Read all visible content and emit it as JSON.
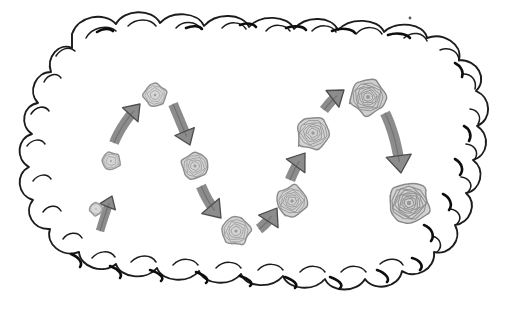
{
  "illustration": {
    "title": "Hand-drawn cloud containing a zigzag sequence of growing spiral swirls connected by arrows",
    "style": "hand-drawn sketch, black ink outline, grayscale fills",
    "background_color": "#ffffff",
    "ink_color": "#1a1a1a",
    "arrow_fill": "#8c8c8c",
    "arrow_stroke": "#4d4d4d"
  },
  "cloud": {
    "name": "thought-cloud-outline",
    "stroke_color": "#1a1a1a",
    "fill_color": "#ffffff",
    "bumps_top": 9,
    "bumps_bottom": 8,
    "bounds": {
      "x": 14,
      "y": 12,
      "width": 482,
      "height": 286
    }
  },
  "nodes": [
    {
      "id": 1,
      "name": "swirl-1",
      "cx": 96,
      "cy": 209,
      "r": 6.5,
      "rings": 1,
      "fill": "#d8d8d8",
      "stroke": "#9a9a9a"
    },
    {
      "id": 2,
      "name": "swirl-2",
      "cx": 111,
      "cy": 161,
      "r": 9.0,
      "rings": 2,
      "fill": "#d4d4d4",
      "stroke": "#949494"
    },
    {
      "id": 3,
      "name": "swirl-3",
      "cx": 155,
      "cy": 95,
      "r": 11.5,
      "rings": 3,
      "fill": "#d6d6d6",
      "stroke": "#8f8f8f"
    },
    {
      "id": 4,
      "name": "swirl-4",
      "cx": 195,
      "cy": 166,
      "r": 13.5,
      "rings": 4,
      "fill": "#d2d2d2",
      "stroke": "#8c8c8c"
    },
    {
      "id": 5,
      "name": "swirl-5",
      "cx": 236,
      "cy": 231,
      "r": 14.5,
      "rings": 4,
      "fill": "#d3d3d3",
      "stroke": "#8c8c8c"
    },
    {
      "id": 6,
      "name": "swirl-6",
      "cx": 292,
      "cy": 201,
      "r": 15.5,
      "rings": 5,
      "fill": "#d1d1d1",
      "stroke": "#8a8a8a"
    },
    {
      "id": 7,
      "name": "swirl-7",
      "cx": 313,
      "cy": 133,
      "r": 16.5,
      "rings": 5,
      "fill": "#d2d2d2",
      "stroke": "#8a8a8a"
    },
    {
      "id": 8,
      "name": "swirl-8",
      "cx": 368,
      "cy": 97,
      "r": 18.0,
      "rings": 6,
      "fill": "#cfcfcf",
      "stroke": "#888888"
    },
    {
      "id": 9,
      "name": "swirl-9",
      "cx": 409,
      "cy": 203,
      "r": 21.0,
      "rings": 7,
      "fill": "#d3d3d3",
      "stroke": "#888888"
    }
  ],
  "arrows": [
    {
      "id": 1,
      "name": "arrow-up-1",
      "from_node": 1,
      "to_node": 2,
      "direction": "up-right",
      "path": "M 100 231 C 103 221 107 208 112 196",
      "width": 8.5,
      "head": 8
    },
    {
      "id": 2,
      "name": "arrow-up-2",
      "from_node": 2,
      "to_node": 3,
      "direction": "up-right",
      "path": "M 114 143 C 119 130 128 117 140 104",
      "width": 10,
      "head": 10
    },
    {
      "id": 3,
      "name": "arrow-down-1",
      "from_node": 3,
      "to_node": 4,
      "direction": "down-right",
      "path": "M 173 104 C 178 116 184 130 190 145",
      "width": 10,
      "head": 10
    },
    {
      "id": 4,
      "name": "arrow-down-2",
      "from_node": 4,
      "to_node": 5,
      "direction": "down-right",
      "path": "M 201 186 C 206 198 212 208 221 218",
      "width": 10.5,
      "head": 11
    },
    {
      "id": 5,
      "name": "arrow-up-3",
      "from_node": 5,
      "to_node": 6,
      "direction": "up-right",
      "path": "M 259 229 C 266 224 272 216 277 208",
      "width": 10.5,
      "head": 11
    },
    {
      "id": 6,
      "name": "arrow-up-4",
      "from_node": 6,
      "to_node": 7,
      "direction": "up-right",
      "path": "M 290 180 C 294 170 299 161 305 153",
      "width": 10.5,
      "head": 11
    },
    {
      "id": 7,
      "name": "arrow-up-5",
      "from_node": 7,
      "to_node": 8,
      "direction": "up-right",
      "path": "M 324 110 C 330 102 336 96 344 90",
      "width": 10,
      "head": 10
    },
    {
      "id": 8,
      "name": "arrow-down-3",
      "from_node": 8,
      "to_node": 9,
      "direction": "down-right",
      "path": "M 385 113 C 393 129 398 150 401 173",
      "width": 10.5,
      "head": 12
    }
  ],
  "speck": {
    "name": "ink-speck",
    "cx": 410,
    "cy": 18,
    "r": 1.4,
    "color": "#555555"
  }
}
